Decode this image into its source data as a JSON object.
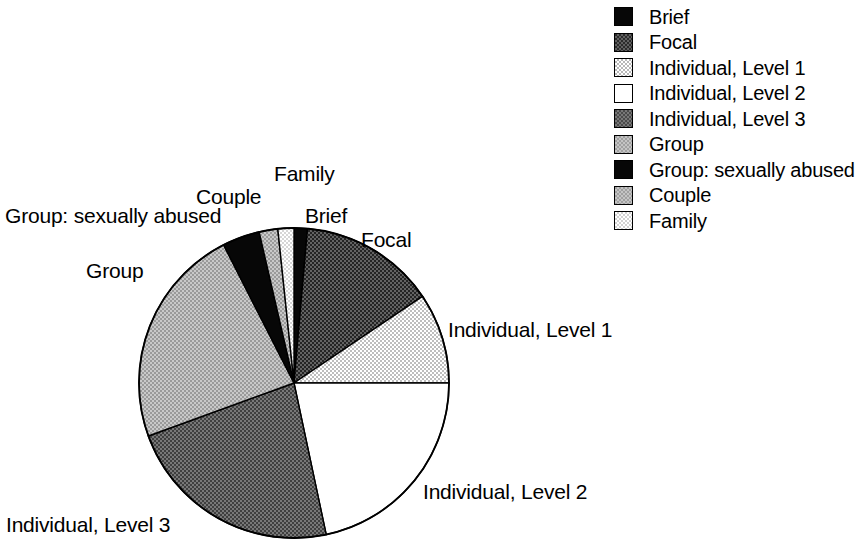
{
  "chart_data": {
    "type": "pie",
    "title": "",
    "subtitle": "",
    "xlabel": "",
    "ylabel": "",
    "legend_position": "right",
    "grid": false,
    "start_angle_deg": 0,
    "direction": "clockwise",
    "categories": [
      "Brief",
      "Focal",
      "Individual, Level 1",
      "Individual, Level 2",
      "Individual, Level 3",
      "Group",
      "Group: sexually abused",
      "Couple",
      "Family"
    ],
    "values": [
      1.4,
      14.2,
      9.4,
      21.7,
      22.8,
      23.1,
      3.9,
      2.0,
      1.5
    ],
    "unit": "percent",
    "slices": [
      {
        "label": "Brief",
        "value": 1.4,
        "start_deg": 0.0,
        "end_deg": 5.0,
        "sweep_deg": 5.0,
        "fill": "black",
        "swatch": "black"
      },
      {
        "label": "Focal",
        "value": 14.2,
        "start_deg": 5.0,
        "end_deg": 56.0,
        "sweep_deg": 51.0,
        "fill": "darkdither",
        "swatch": "darkdither"
      },
      {
        "label": "Individual, Level 1",
        "value": 9.4,
        "start_deg": 56.0,
        "end_deg": 90.0,
        "sweep_deg": 34.0,
        "fill": "lightdither",
        "swatch": "lightdither"
      },
      {
        "label": "Individual, Level 2",
        "value": 21.7,
        "start_deg": 90.0,
        "end_deg": 168.0,
        "sweep_deg": 78.0,
        "fill": "white",
        "swatch": "white"
      },
      {
        "label": "Individual, Level 3",
        "value": 22.8,
        "start_deg": 168.0,
        "end_deg": 250.0,
        "sweep_deg": 82.0,
        "fill": "middark",
        "swatch": "middark"
      },
      {
        "label": "Group",
        "value": 23.1,
        "start_deg": 250.0,
        "end_deg": 333.0,
        "sweep_deg": 83.0,
        "fill": "midgray",
        "swatch": "midgray"
      },
      {
        "label": "Group: sexually abused",
        "value": 3.9,
        "start_deg": 333.0,
        "end_deg": 347.0,
        "sweep_deg": 14.0,
        "fill": "black",
        "swatch": "black"
      },
      {
        "label": "Couple",
        "value": 2.0,
        "start_deg": 347.0,
        "end_deg": 354.0,
        "sweep_deg": 7.0,
        "fill": "midgray",
        "swatch": "midgray"
      },
      {
        "label": "Family",
        "value": 1.5,
        "start_deg": 354.0,
        "end_deg": 360.0,
        "sweep_deg": 6.0,
        "fill": "palegray",
        "swatch": "palegray"
      }
    ],
    "geometry": {
      "cx": 294,
      "cy": 383,
      "r": 155
    },
    "colors": {
      "black": "#070707",
      "darkdither": "#3b3b3b",
      "lightdither": "#dedede",
      "white": "#ffffff",
      "middark": "#585858",
      "midgray": "#b0b0b0",
      "palegray": "#e8e8e8",
      "outline": "#000000",
      "background": "#ffffff"
    }
  },
  "slice_labels": {
    "family": "Family",
    "couple": "Couple",
    "brief": "Brief",
    "group_sexually_abused": "Group: sexually abused",
    "focal": "Focal",
    "group": "Group",
    "individual_level_1": "Individual, Level 1",
    "individual_level_2": "Individual, Level 2",
    "individual_level_3": "Individual, Level 3"
  },
  "legend": {
    "items": [
      {
        "label": "Brief",
        "swatch": "black"
      },
      {
        "label": "Focal",
        "swatch": "darkdither"
      },
      {
        "label": "Individual, Level 1",
        "swatch": "lightdither"
      },
      {
        "label": "Individual, Level 2",
        "swatch": "white"
      },
      {
        "label": "Individual, Level 3",
        "swatch": "middark"
      },
      {
        "label": "Group",
        "swatch": "midgray"
      },
      {
        "label": "Group: sexually abused",
        "swatch": "black"
      },
      {
        "label": "Couple",
        "swatch": "midgray"
      },
      {
        "label": "Family",
        "swatch": "palegray"
      }
    ]
  }
}
